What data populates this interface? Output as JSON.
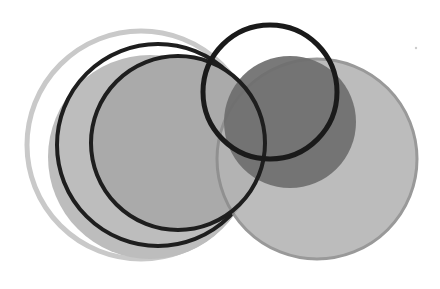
{
  "image": {
    "description": "Abstract composition of overlapping circles in grayscale",
    "width": 440,
    "height": 289,
    "background": "#ffffff"
  },
  "shapes": [
    {
      "name": "outer-light-ring",
      "kind": "ring",
      "cx": 141,
      "cy": 145,
      "r": 114,
      "stroke": "#c9c9c9",
      "stroke_width": 5,
      "fill": "none"
    },
    {
      "name": "left-light-disk",
      "kind": "disk",
      "cx": 150,
      "cy": 157,
      "r": 102,
      "fill": "#bdbdbd",
      "opacity": 1
    },
    {
      "name": "left-black-ring-large",
      "kind": "ring",
      "cx": 158,
      "cy": 145,
      "r": 101,
      "stroke": "#1e1e1e",
      "stroke_width": 4,
      "fill": "none"
    },
    {
      "name": "left-inner-gray-disk",
      "kind": "disk",
      "cx": 178,
      "cy": 143,
      "r": 87,
      "fill": "#aaaaaa",
      "opacity": 1
    },
    {
      "name": "right-medium-disk",
      "kind": "disk",
      "cx": 317,
      "cy": 159,
      "r": 100,
      "fill": "#b5b5b5",
      "stroke": "#8e8e8e",
      "stroke_width": 3,
      "opacity": 0.9
    },
    {
      "name": "dark-gray-disk",
      "kind": "disk",
      "cx": 290,
      "cy": 122,
      "r": 66,
      "fill": "#6e6e6e",
      "opacity": 0.92
    },
    {
      "name": "left-black-ring-inner",
      "kind": "ring",
      "cx": 178,
      "cy": 143,
      "r": 87,
      "stroke": "#1e1e1e",
      "stroke_width": 4,
      "fill": "none"
    },
    {
      "name": "upper-black-ring",
      "kind": "ring",
      "cx": 270,
      "cy": 92,
      "r": 67,
      "stroke": "#1a1a1a",
      "stroke_width": 5,
      "fill": "none"
    },
    {
      "name": "faint-speck",
      "kind": "disk",
      "cx": 416,
      "cy": 48,
      "r": 1.2,
      "fill": "#cccccc",
      "opacity": 1
    }
  ]
}
